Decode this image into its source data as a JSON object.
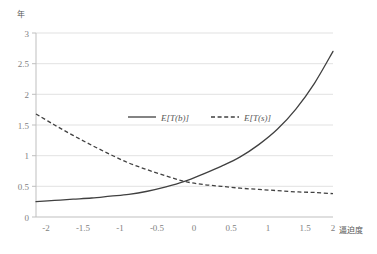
{
  "chart_data": {
    "type": "line",
    "title": "",
    "subtitle": "",
    "xlabel": "逼迫度",
    "ylabel": "年",
    "xlim": [
      -2,
      2
    ],
    "ylim": [
      0,
      3
    ],
    "grid": "horizontal",
    "legend_position": "inside-upper-center",
    "x_ticks": [
      "-2",
      "-1.5",
      "-1",
      "-0.5",
      "0",
      "0.5",
      "1",
      "1.5",
      "2"
    ],
    "x_tick_values": [
      -2,
      -1.5,
      -1,
      -0.5,
      0,
      0.5,
      1,
      1.5,
      2
    ],
    "y_ticks": [
      "0",
      "0.5",
      "1",
      "1.5",
      "2",
      "2.5",
      "3"
    ],
    "y_tick_values": [
      0,
      0.5,
      1,
      1.5,
      2,
      2.5,
      3
    ],
    "x": [
      -2,
      -1.75,
      -1.5,
      -1.25,
      -1,
      -0.75,
      -0.5,
      -0.25,
      0,
      0.25,
      0.5,
      0.75,
      1,
      1.25,
      1.5,
      1.75,
      2
    ],
    "series": [
      {
        "name": "E[T(b)]",
        "style": "solid",
        "color": "#404040",
        "values": [
          0.25,
          0.27,
          0.29,
          0.31,
          0.34,
          0.37,
          0.42,
          0.49,
          0.58,
          0.7,
          0.83,
          0.98,
          1.18,
          1.43,
          1.76,
          2.18,
          2.7
        ]
      },
      {
        "name": "E[T(s)]",
        "style": "dashed",
        "color": "#404040",
        "values": [
          1.68,
          1.5,
          1.33,
          1.17,
          1.02,
          0.88,
          0.77,
          0.67,
          0.58,
          0.53,
          0.5,
          0.47,
          0.45,
          0.43,
          0.41,
          0.4,
          0.38
        ]
      }
    ],
    "colors": {
      "series_line": "#404040",
      "gridline": "#d9d9d9",
      "axis": "#bfbfbf",
      "tick_label": "#7f7f7f",
      "unit_label": "#595959",
      "background": "#ffffff"
    }
  },
  "legend": {
    "items": [
      {
        "label": "E[T(b)]",
        "style": "solid"
      },
      {
        "label": "E[T(s)]",
        "style": "dashed"
      }
    ]
  }
}
